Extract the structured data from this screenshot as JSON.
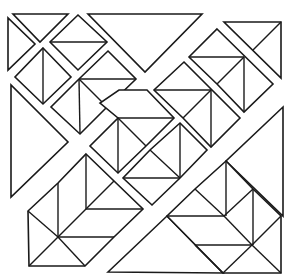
{
  "figure": {
    "stroke_color": "#1a1a1a",
    "background": "#ffffff",
    "shapes": [
      {
        "name": "top-left-small-triangle",
        "points": "13,14 68,14 40,42"
      },
      {
        "name": "left-small-triangle",
        "points": "8,18 8,70 35,44"
      },
      {
        "name": "top-diamond",
        "points": "78,15 107,42 78,70 50,42",
        "lines": [
          [
            50,
            42,
            107,
            42
          ]
        ]
      },
      {
        "name": "left-diamond",
        "points": "43,48 71,77 43,104 15,77",
        "lines": [
          [
            43,
            48,
            43,
            104
          ]
        ]
      },
      {
        "name": "left-hexagon",
        "points": "108,51 136,79 107,107 80,134 51,107 79,79",
        "lines": [
          [
            79,
            79,
            136,
            79
          ],
          [
            79,
            79,
            80,
            134
          ],
          [
            79,
            79,
            107,
            107
          ]
        ]
      },
      {
        "name": "top-large-triangle",
        "points": "88,14 202,14 145,72"
      },
      {
        "name": "top-right-triangle",
        "points": "224,22 281,22 281,78",
        "lines": [
          [
            253,
            50,
            281,
            22
          ]
        ]
      },
      {
        "name": "upper-right-hexagon",
        "points": "217,29 273,84 244,112 217,84 189,57",
        "lines": [
          [
            189,
            57,
            244,
            57
          ],
          [
            244,
            57,
            244,
            112
          ],
          [
            244,
            57,
            217,
            84
          ]
        ]
      },
      {
        "name": "center-upper-hexagon",
        "points": "184,62 240,118 211,147 183,118 154,90",
        "lines": [
          [
            154,
            90,
            211,
            90
          ],
          [
            211,
            90,
            211,
            147
          ],
          [
            211,
            90,
            183,
            118
          ]
        ]
      },
      {
        "name": "center-hexagon",
        "points": "147,90 174,118 146,146 118,173 90,146 118,118 100,103 119,90",
        "lines": [
          [
            118,
            118,
            174,
            118
          ],
          [
            118,
            118,
            118,
            173
          ],
          [
            118,
            118,
            146,
            146
          ]
        ]
      },
      {
        "name": "center-lower-hexagon",
        "points": "180,123 207,150 180,178 152,205 123,178 150,150",
        "lines": [
          [
            123,
            178,
            180,
            178
          ],
          [
            180,
            123,
            180,
            178
          ],
          [
            150,
            150,
            180,
            178
          ]
        ]
      },
      {
        "name": "left-large-triangle",
        "points": "11,85 11,197 68,142"
      },
      {
        "name": "bottom-left-cluster",
        "points": "86,154 143,209 114,237 85,266 29,266 28,211 58,183",
        "lines": [
          [
            86,
            154,
            86,
            209
          ],
          [
            58,
            183,
            58,
            237
          ],
          [
            86,
            209,
            143,
            209
          ],
          [
            58,
            237,
            114,
            237
          ],
          [
            86,
            209,
            114,
            181
          ],
          [
            58,
            237,
            86,
            209
          ],
          [
            28,
            211,
            58,
            237
          ],
          [
            58,
            237,
            85,
            266
          ],
          [
            29,
            266,
            58,
            237
          ]
        ]
      },
      {
        "name": "bottom-large-triangle",
        "points": "108,272 167,216 223,273"
      },
      {
        "name": "right-large-triangle",
        "points": "283,107 283,216 226,161"
      },
      {
        "name": "bottom-right-cluster",
        "points": "226,161 253,189 281,216 281,273 223,273 167,216 195,189",
        "lines": [
          [
            226,
            161,
            226,
            216
          ],
          [
            253,
            189,
            253,
            245
          ],
          [
            167,
            216,
            224,
            216
          ],
          [
            195,
            245,
            253,
            245
          ],
          [
            195,
            189,
            224,
            216
          ],
          [
            224,
            216,
            253,
            189
          ],
          [
            224,
            216,
            252,
            245
          ],
          [
            252,
            245,
            281,
            216
          ],
          [
            195,
            245,
            223,
            273
          ],
          [
            223,
            273,
            252,
            245
          ],
          [
            252,
            245,
            281,
            273
          ]
        ]
      }
    ]
  }
}
